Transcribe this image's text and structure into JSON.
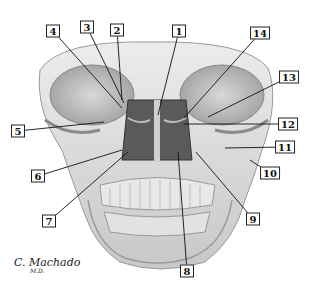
{
  "figure": {
    "artist_signature": "C. Machado",
    "artist_suffix": "M.D.",
    "colors": {
      "line": "#111111",
      "bone_light": "#e6e6e6",
      "bone_mid": "#bdbdbd",
      "bone_dark": "#6e6e6e",
      "cavity": "#3a3a3a"
    },
    "labels": [
      {
        "id": "1",
        "text": "1",
        "x": 179,
        "y": 31,
        "target": [
          158,
          115
        ]
      },
      {
        "id": "2",
        "text": "2",
        "x": 117,
        "y": 30,
        "target": [
          122,
          100
        ]
      },
      {
        "id": "3",
        "text": "3",
        "x": 87,
        "y": 27,
        "target": [
          124,
          103
        ]
      },
      {
        "id": "4",
        "text": "4",
        "x": 53,
        "y": 31,
        "target": [
          122,
          108
        ]
      },
      {
        "id": "5",
        "text": "5",
        "x": 18,
        "y": 131,
        "target": [
          104,
          122
        ]
      },
      {
        "id": "6",
        "text": "6",
        "x": 38,
        "y": 176,
        "target": [
          122,
          150
        ]
      },
      {
        "id": "7",
        "text": "7",
        "x": 49,
        "y": 221,
        "target": [
          128,
          152
        ]
      },
      {
        "id": "8",
        "text": "8",
        "x": 187,
        "y": 271,
        "target": [
          178,
          152
        ]
      },
      {
        "id": "9",
        "text": "9",
        "x": 253,
        "y": 219,
        "target": [
          196,
          152
        ]
      },
      {
        "id": "10",
        "text": "10",
        "x": 270,
        "y": 173,
        "target": [
          250,
          160
        ]
      },
      {
        "id": "11",
        "text": "11",
        "x": 285,
        "y": 147,
        "target": [
          225,
          148
        ]
      },
      {
        "id": "12",
        "text": "12",
        "x": 288,
        "y": 124,
        "target": [
          184,
          124
        ]
      },
      {
        "id": "13",
        "text": "13",
        "x": 289,
        "y": 77,
        "target": [
          208,
          117
        ]
      },
      {
        "id": "14",
        "text": "14",
        "x": 260,
        "y": 33,
        "target": [
          184,
          118
        ]
      }
    ]
  }
}
